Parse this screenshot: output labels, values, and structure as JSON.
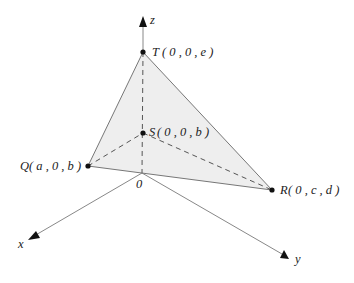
{
  "diagram": {
    "type": "3d-coordinate-tetrahedron",
    "axes": {
      "x": {
        "label": "x"
      },
      "y": {
        "label": "y"
      },
      "z": {
        "label": "z"
      },
      "origin": {
        "label": "0"
      }
    },
    "points": {
      "T": {
        "name": "T",
        "coords": "( 0 , 0 , e )"
      },
      "S": {
        "name": "S",
        "coords": "( 0 , 0 , b )"
      },
      "Q": {
        "name": "Q",
        "coords": "( a , 0 , b )"
      },
      "R": {
        "name": "R",
        "coords": "( 0 , c , d )"
      }
    },
    "colors": {
      "face_fill": "#eeeeee",
      "edge": "#777777",
      "axis": "#888888",
      "point": "#111111",
      "arrow": "#111111"
    }
  }
}
